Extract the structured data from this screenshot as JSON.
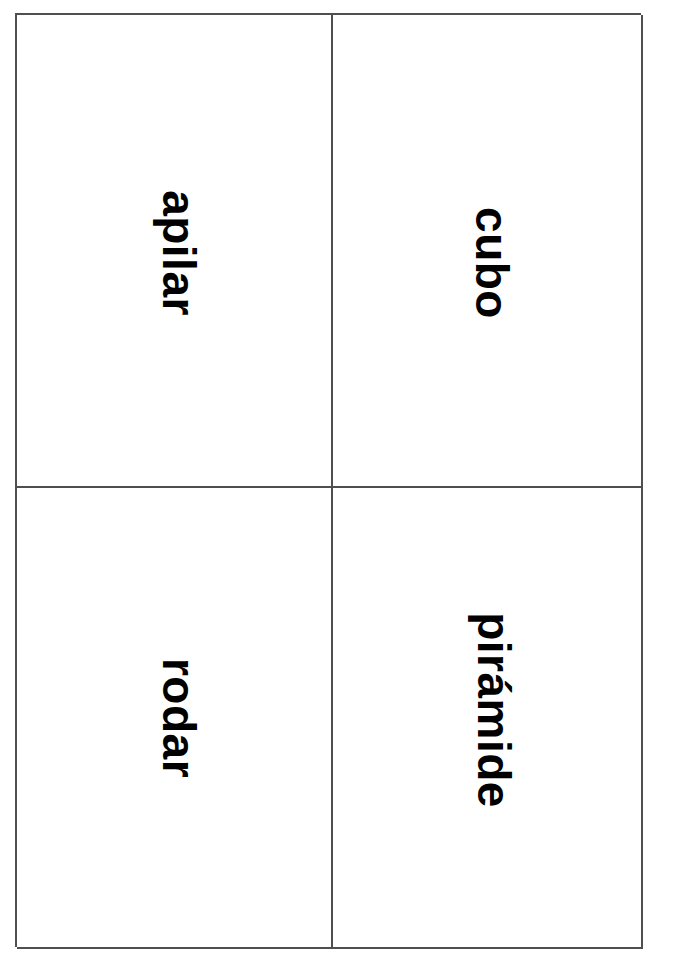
{
  "page": {
    "background_color": "#ffffff",
    "border_color": "#4f4f4f",
    "text_color": "#000000",
    "language": "es"
  },
  "card_sheet": {
    "title": "Tarjetas de vocabulario",
    "rows": 2,
    "columns": 2,
    "text_orientation": "rotated-90-clockwise",
    "cards": [
      {
        "id": "apilar",
        "label": "apilar",
        "row": 1,
        "column": 1
      },
      {
        "id": "cubo",
        "label": "cubo",
        "row": 1,
        "column": 2
      },
      {
        "id": "rodar",
        "label": "rodar",
        "row": 2,
        "column": 1
      },
      {
        "id": "piramide",
        "label": "pirámide",
        "row": 2,
        "column": 2
      }
    ]
  }
}
